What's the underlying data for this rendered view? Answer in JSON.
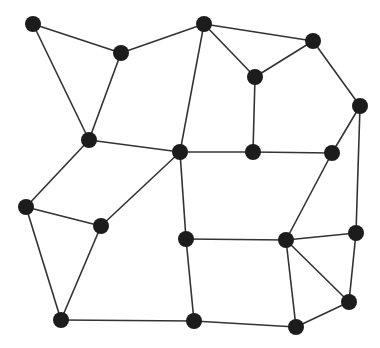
{
  "diagram": {
    "type": "undirected-graph",
    "node_color": "#1c1c1c",
    "edge_color": "#333333",
    "background": "#ffffff",
    "node_radius": 8,
    "nodes": [
      {
        "id": "A",
        "x": 33,
        "y": 24
      },
      {
        "id": "B",
        "x": 121,
        "y": 53
      },
      {
        "id": "C",
        "x": 204,
        "y": 24
      },
      {
        "id": "D",
        "x": 313,
        "y": 41
      },
      {
        "id": "E",
        "x": 255,
        "y": 77
      },
      {
        "id": "F",
        "x": 360,
        "y": 106
      },
      {
        "id": "G",
        "x": 89,
        "y": 140
      },
      {
        "id": "H",
        "x": 180,
        "y": 152
      },
      {
        "id": "I",
        "x": 253,
        "y": 152
      },
      {
        "id": "J",
        "x": 332,
        "y": 153
      },
      {
        "id": "K",
        "x": 26,
        "y": 207
      },
      {
        "id": "L",
        "x": 101,
        "y": 226
      },
      {
        "id": "M",
        "x": 186,
        "y": 239
      },
      {
        "id": "N",
        "x": 286,
        "y": 240
      },
      {
        "id": "O",
        "x": 356,
        "y": 233
      },
      {
        "id": "P",
        "x": 349,
        "y": 302
      },
      {
        "id": "Q",
        "x": 61,
        "y": 320
      },
      {
        "id": "R",
        "x": 194,
        "y": 321
      },
      {
        "id": "S",
        "x": 296,
        "y": 327
      }
    ],
    "edges": [
      [
        "A",
        "B"
      ],
      [
        "A",
        "G"
      ],
      [
        "B",
        "C"
      ],
      [
        "B",
        "G"
      ],
      [
        "C",
        "D"
      ],
      [
        "C",
        "E"
      ],
      [
        "C",
        "H"
      ],
      [
        "D",
        "E"
      ],
      [
        "D",
        "F"
      ],
      [
        "E",
        "I"
      ],
      [
        "F",
        "J"
      ],
      [
        "F",
        "O"
      ],
      [
        "G",
        "H"
      ],
      [
        "G",
        "K"
      ],
      [
        "H",
        "I"
      ],
      [
        "H",
        "L"
      ],
      [
        "H",
        "M"
      ],
      [
        "I",
        "J"
      ],
      [
        "J",
        "N"
      ],
      [
        "K",
        "L"
      ],
      [
        "K",
        "Q"
      ],
      [
        "L",
        "Q"
      ],
      [
        "M",
        "N"
      ],
      [
        "M",
        "R"
      ],
      [
        "N",
        "O"
      ],
      [
        "N",
        "P"
      ],
      [
        "N",
        "S"
      ],
      [
        "O",
        "P"
      ],
      [
        "P",
        "S"
      ],
      [
        "Q",
        "R"
      ],
      [
        "R",
        "S"
      ]
    ]
  }
}
